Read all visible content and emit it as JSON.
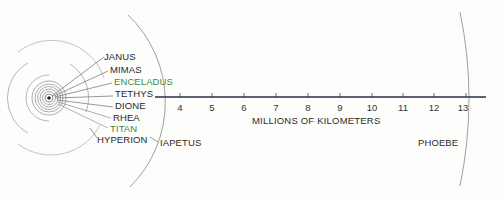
{
  "diagram": {
    "axis": {
      "label": "MILLIONS OF KILOMETERS",
      "ticks": [
        "4",
        "5",
        "6",
        "7",
        "8",
        "9",
        "10",
        "11",
        "12",
        "13"
      ],
      "line_color": "#2b2d4a"
    },
    "inner_moons": [
      {
        "name": "JANUS",
        "color": "#2a2a2a"
      },
      {
        "name": "MIMAS",
        "color": "#2a2a2a"
      },
      {
        "name": "ENCELADUS",
        "color": "#3d8a3a"
      },
      {
        "name": "TETHYS",
        "color": "#2a2a2a"
      },
      {
        "name": "DIONE",
        "color": "#2a2a2a"
      },
      {
        "name": "RHEA",
        "color": "#2a2a2a"
      },
      {
        "name": "TITAN",
        "color": "#3d8a3a"
      },
      {
        "name": "HYPERION",
        "color": "#2a2a2a"
      }
    ],
    "outer_moons": [
      {
        "name": "IAPETUS"
      },
      {
        "name": "PHOEBE"
      }
    ],
    "colors": {
      "orbit": "#8a8a8a",
      "label_dark": "#2a2a2a",
      "label_green": "#3d8a3a",
      "leader_tint": "#8a6a9a"
    }
  }
}
